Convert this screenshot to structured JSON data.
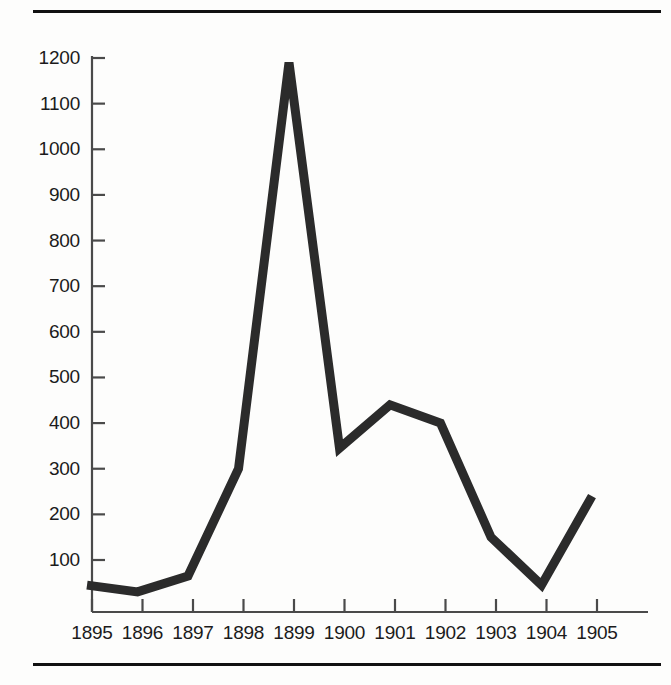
{
  "figure": {
    "background_color": "#fdfdfc",
    "rule_color": "#111111",
    "line_color": "#2b2b2b",
    "axis_color": "#4a4a4a"
  },
  "chart_data": {
    "type": "line",
    "title": "",
    "subtitle": "",
    "xlabel": "",
    "ylabel": "",
    "grid": false,
    "legend": null,
    "categories": [
      "1895",
      "1896",
      "1897",
      "1898",
      "1899",
      "1900",
      "1901",
      "1902",
      "1903",
      "1904",
      "1905"
    ],
    "x": [
      1895,
      1896,
      1897,
      1898,
      1899,
      1900,
      1901,
      1902,
      1903,
      1904,
      1905
    ],
    "values": [
      45,
      30,
      65,
      300,
      1190,
      345,
      440,
      400,
      150,
      45,
      240
    ],
    "series": [
      {
        "name": "",
        "values": [
          45,
          30,
          65,
          300,
          1190,
          345,
          440,
          400,
          150,
          45,
          240
        ]
      }
    ],
    "xlim": [
      1895,
      1905
    ],
    "ylim": [
      0,
      1250
    ],
    "yticks": [
      100,
      200,
      300,
      400,
      500,
      600,
      700,
      800,
      900,
      1000,
      1100,
      1200
    ],
    "ytick_labels": [
      "100",
      "200",
      "300",
      "400",
      "500",
      "600",
      "700",
      "800",
      "900",
      "1000",
      "1100",
      "1200"
    ],
    "xticks": [
      1895,
      1896,
      1897,
      1898,
      1899,
      1900,
      1901,
      1902,
      1903,
      1904,
      1905
    ],
    "xtick_labels": [
      "1895",
      "1896",
      "1897",
      "1898",
      "1899",
      "1900",
      "1901",
      "1902",
      "1903",
      "1904",
      "1905"
    ],
    "annotations": []
  },
  "axes": {
    "y_tick_labels": [
      "1200",
      "1100",
      "1000",
      "900",
      "800",
      "700",
      "600",
      "500",
      "400",
      "300",
      "200",
      "100"
    ],
    "x_tick_labels": [
      "1895",
      "1896",
      "1897",
      "1898",
      "1899",
      "1900",
      "1901",
      "1902",
      "1903",
      "1904",
      "1905"
    ]
  }
}
